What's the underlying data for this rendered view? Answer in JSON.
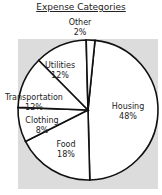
{
  "chart_data": {
    "type": "pie",
    "title": "Expense Categories",
    "categories": [
      "Housing",
      "Food",
      "Clothing",
      "Transportation",
      "Utilities",
      "Other"
    ],
    "values": [
      48,
      18,
      8,
      12,
      12,
      2
    ],
    "unit": "%",
    "labels": [
      {
        "name": "Housing",
        "pct": "48%"
      },
      {
        "name": "Food",
        "pct": "18%"
      },
      {
        "name": "Clothing",
        "pct": "8%"
      },
      {
        "name": "Transportation",
        "pct": "12%"
      },
      {
        "name": "Utilities",
        "pct": "12%"
      },
      {
        "name": "Other",
        "pct": "2%"
      }
    ],
    "colors": {
      "slice_fill": "#ffffff",
      "outline": "#111111",
      "background": "#dcdcdc"
    }
  }
}
